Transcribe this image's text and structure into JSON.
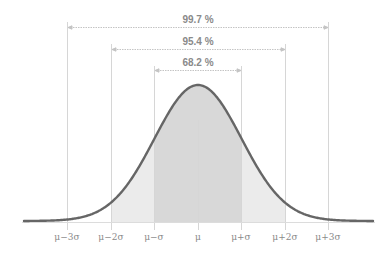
{
  "chart_data": {
    "type": "area",
    "title": "",
    "tick_labels": [
      "μ−3σ",
      "μ−2σ",
      "μ−σ",
      "μ",
      "μ+σ",
      "μ+2σ",
      "μ+3σ"
    ],
    "intervals": [
      {
        "label": "68.2 %",
        "from": "μ−σ",
        "to": "μ+σ",
        "value": 68.2
      },
      {
        "label": "95.4 %",
        "from": "μ−2σ",
        "to": "μ+2σ",
        "value": 95.4
      },
      {
        "label": "99.7 %",
        "from": "μ−3σ",
        "to": "μ+3σ",
        "value": 99.7
      }
    ],
    "shading": [
      "μ−2σ to μ+2σ light",
      "μ−σ to μ+σ darker"
    ],
    "grid": false,
    "legend": "none"
  },
  "labels": {
    "pct_997": "99.7 %",
    "pct_954": "95.4 %",
    "pct_682": "68.2 %",
    "t0": "μ−3σ",
    "t1": "μ−2σ",
    "t2": "μ−σ",
    "t3": "μ",
    "t4": "μ+σ",
    "t5": "μ+2σ",
    "t6": "μ+3σ"
  },
  "colors": {
    "curve": "#666666",
    "text": "#8a8a8a",
    "guides": "#d0d0d0",
    "shade_inner": "#d6d6d6",
    "shade_outer": "#ebebeb"
  }
}
